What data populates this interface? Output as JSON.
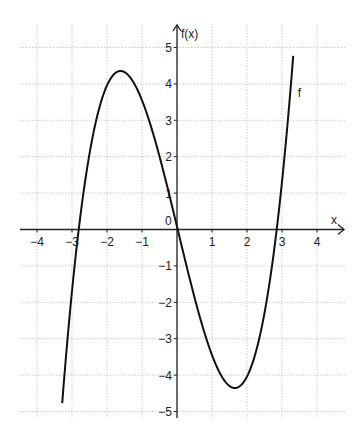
{
  "chart_data": {
    "type": "line",
    "title": "",
    "xlabel": "x",
    "ylabel": "f(x)",
    "xlim": [
      -4.5,
      4.6
    ],
    "ylim": [
      -5.2,
      5.6
    ],
    "grid": true,
    "x_ticks": [
      -4,
      -3,
      -2,
      -1,
      0,
      1,
      2,
      3,
      4
    ],
    "x_tick_labels": [
      "-4",
      "-3",
      "-2",
      "-1",
      "0",
      "1",
      "2",
      "3",
      "4"
    ],
    "y_ticks": [
      -5,
      -4,
      -3,
      -2,
      -1,
      0,
      1,
      2,
      3,
      4,
      5
    ],
    "y_tick_labels": [
      "−5",
      "−4",
      "−3",
      "−2",
      "−1",
      "0",
      "1",
      "2",
      "3",
      "4",
      "5"
    ],
    "series": [
      {
        "name": "f",
        "label": "f",
        "formula_approx": "f(x) = 0.5x^3 - 4x",
        "coefficients": {
          "a3": 0.5,
          "a2": 0,
          "a1": -4,
          "a0": 0
        },
        "x_range": [
          -3.3,
          3.3
        ],
        "key_points": {
          "roots": [
            -2.85,
            0,
            2.85
          ],
          "local_max": [
            -1.65,
            4.35
          ],
          "local_min": [
            1.65,
            -4.35
          ]
        },
        "x": [
          -3.3,
          -3.0,
          -2.83,
          -2.5,
          -2.0,
          -1.65,
          -1.0,
          -0.5,
          0,
          0.5,
          1.0,
          1.65,
          2.0,
          2.5,
          2.83,
          3.0,
          3.3
        ],
        "y": [
          -4.77,
          -1.5,
          0,
          2.19,
          4.0,
          4.35,
          3.5,
          1.94,
          0,
          -1.94,
          -3.5,
          -4.35,
          -4.0,
          -2.19,
          0,
          1.5,
          4.77
        ]
      }
    ],
    "annotations": [
      {
        "text": "f",
        "x": 3.45,
        "y": 3.75
      },
      {
        "text": "0",
        "x": -0.25,
        "y": 0.25,
        "note": "origin label"
      }
    ],
    "colors": {
      "curve": "#111111",
      "grid": "#bdbdbd",
      "axis": "#222222",
      "background": "#ffffff"
    }
  },
  "plot": {
    "x_axis_label": "x",
    "y_axis_label": "f(x)",
    "curve_label": "f",
    "origin_label": "0"
  }
}
